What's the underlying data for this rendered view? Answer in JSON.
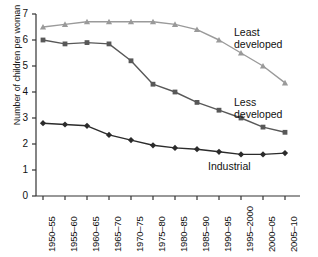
{
  "chart_data": {
    "type": "line",
    "title": "",
    "xlabel": "",
    "ylabel": "Number of children per woman",
    "ylim": [
      0,
      7
    ],
    "yticks": [
      0,
      1,
      2,
      3,
      4,
      5,
      6,
      7
    ],
    "grid": false,
    "legend_position": "inline-right",
    "categories": [
      "1950–55",
      "1955–60",
      "1960–65",
      "1965–70",
      "1970–75",
      "1975–80",
      "1980–85",
      "1985–90",
      "1990–95",
      "1995–2000",
      "2000–05",
      "2005–10"
    ],
    "series": [
      {
        "name": "Least developed",
        "label_lines": [
          "Least",
          "developed"
        ],
        "color": "#9a9a9a",
        "marker": "triangle",
        "values": [
          6.5,
          6.6,
          6.7,
          6.7,
          6.7,
          6.7,
          6.6,
          6.4,
          6.0,
          5.5,
          5.0,
          4.35
        ]
      },
      {
        "name": "Less developed",
        "label_lines": [
          "Less",
          "developed"
        ],
        "color": "#585858",
        "marker": "square",
        "values": [
          6.0,
          5.85,
          5.9,
          5.85,
          5.2,
          4.3,
          4.0,
          3.6,
          3.3,
          3.0,
          2.65,
          2.45
        ]
      },
      {
        "name": "Industrial",
        "label_lines": [
          "Industrial"
        ],
        "color": "#2b2b2b",
        "marker": "diamond",
        "values": [
          2.8,
          2.75,
          2.7,
          2.35,
          2.15,
          1.95,
          1.85,
          1.8,
          1.7,
          1.6,
          1.6,
          1.65
        ]
      }
    ]
  },
  "axes": {
    "y_title": "Number of children per woman",
    "y_tick_labels": [
      "7",
      "6",
      "5",
      "4",
      "3",
      "2",
      "1",
      "0"
    ],
    "x_tick_labels": [
      "1950–55",
      "1955–60",
      "1960–65",
      "1965–70",
      "1970–75",
      "1975–80",
      "1980–85",
      "1985–90",
      "1990–95",
      "1995–2000",
      "2000–05",
      "2005–10"
    ]
  },
  "annotations": {
    "least_line1": "Least",
    "least_line2": "developed",
    "less_line1": "Less",
    "less_line2": "developed",
    "industrial": "Industrial"
  }
}
